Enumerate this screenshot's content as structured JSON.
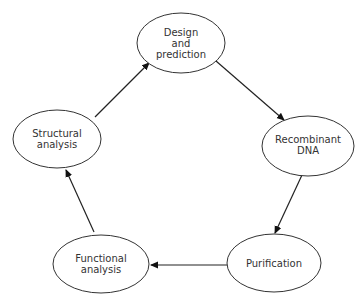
{
  "diagram": {
    "type": "cycle",
    "nodes": [
      {
        "id": "design",
        "lines": [
          "Design",
          "and",
          "prediction"
        ]
      },
      {
        "id": "recombinant",
        "lines": [
          "Recombinant",
          "DNA"
        ]
      },
      {
        "id": "purification",
        "lines": [
          "Purification"
        ]
      },
      {
        "id": "functional",
        "lines": [
          "Functional",
          "analysis"
        ]
      },
      {
        "id": "structural",
        "lines": [
          "Structural",
          "analysis"
        ]
      }
    ],
    "edges": [
      {
        "from": "design",
        "to": "recombinant"
      },
      {
        "from": "recombinant",
        "to": "purification"
      },
      {
        "from": "purification",
        "to": "functional"
      },
      {
        "from": "functional",
        "to": "structural"
      },
      {
        "from": "structural",
        "to": "design"
      }
    ],
    "colors": {
      "stroke": "#333333",
      "text": "#333333",
      "background": "#ffffff"
    }
  }
}
